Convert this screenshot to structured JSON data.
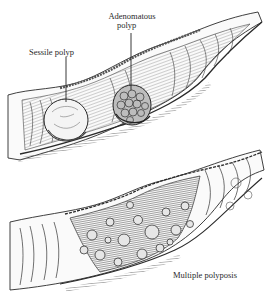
{
  "figure": {
    "style": "pen-and-ink medical line drawing",
    "colors": {
      "ink": "#2a2a2a",
      "shade": "#6a6a6a",
      "paper": "#ffffff"
    }
  },
  "labels": {
    "sessile": "Sessile polyp",
    "adenomatous_line1": "Adenomatous",
    "adenomatous_line2": "polyp",
    "multiple": "Multiple polyposis"
  },
  "panels": [
    {
      "name": "upper-colon-segment",
      "features": [
        "sessile-polyp",
        "adenomatous-polyp"
      ]
    },
    {
      "name": "lower-colon-segment",
      "features": [
        "multiple-polyposis"
      ]
    }
  ]
}
